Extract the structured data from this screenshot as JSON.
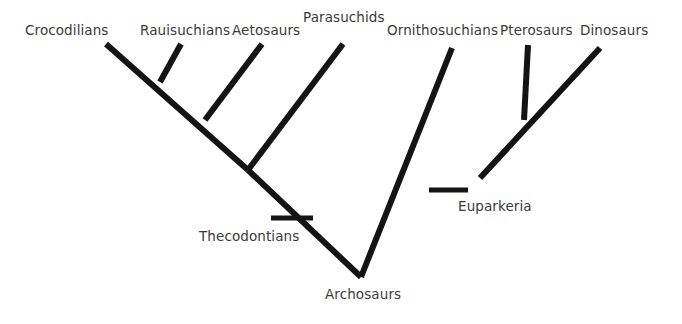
{
  "diagram": {
    "type": "cladogram",
    "title_visible": false,
    "background_color": "#ffffff",
    "line_color": "#141414",
    "text_color": "#3a3a3a",
    "root_label": "Archosaurs"
  },
  "tips": [
    {
      "label": "Crocodilians",
      "label_x": 25,
      "label_y": 24
    },
    {
      "label": "Rauisuchians",
      "label_x": 140,
      "label_y": 24
    },
    {
      "label": "Aetosaurs",
      "label_x": 232,
      "label_y": 24
    },
    {
      "label": "Parasuchids",
      "label_x": 303,
      "label_y": 11
    },
    {
      "label": "Ornithosuchians",
      "label_x": 387,
      "label_y": 24
    },
    {
      "label": "Pterosaurs",
      "label_x": 500,
      "label_y": 24
    },
    {
      "label": "Dinosaurs",
      "label_x": 580,
      "label_y": 24
    }
  ],
  "node_labels": [
    {
      "label": "Thecodontians",
      "label_x": 199,
      "label_y": 230
    },
    {
      "label": "Euparkeria",
      "label_x": 458,
      "label_y": 200
    },
    {
      "label": "Archosaurs",
      "label_x": 325,
      "label_y": 288
    }
  ],
  "branches": [
    {
      "name": "crocodilians-branch",
      "x1": 106,
      "y1": 44,
      "x2": 248,
      "y2": 170
    },
    {
      "name": "rauisuchians-branch",
      "x1": 181,
      "y1": 44,
      "x2": 160,
      "y2": 82
    },
    {
      "name": "aetosaurs-branch",
      "x1": 262,
      "y1": 44,
      "x2": 205,
      "y2": 120
    },
    {
      "name": "parasuchids-branch",
      "x1": 343,
      "y1": 44,
      "x2": 248,
      "y2": 170
    },
    {
      "name": "crocodylia-stem",
      "x1": 248,
      "y1": 170,
      "x2": 361,
      "y2": 277
    },
    {
      "name": "ornithosuchians-branch",
      "x1": 452,
      "y1": 48,
      "x2": 361,
      "y2": 277
    },
    {
      "name": "pterosaurs-branch",
      "x1": 528,
      "y1": 45,
      "x2": 524,
      "y2": 120
    },
    {
      "name": "dinosaurs-branch",
      "x1": 600,
      "y1": 48,
      "x2": 480,
      "y2": 178
    }
  ],
  "tick_marks": [
    {
      "name": "thecodontians-tick",
      "x1": 271,
      "y1": 218,
      "x2": 313,
      "y2": 218
    },
    {
      "name": "euparkeria-tick",
      "x1": 429,
      "y1": 190,
      "x2": 468,
      "y2": 190
    }
  ]
}
